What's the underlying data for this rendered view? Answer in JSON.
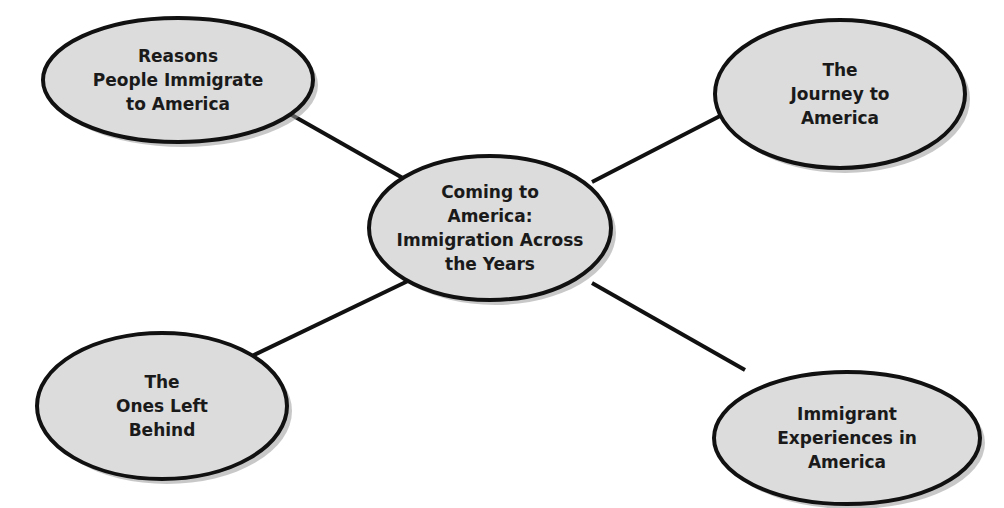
{
  "diagram": {
    "type": "concept-web",
    "colors": {
      "node_fill": "#dcdcdc",
      "node_stroke": "#111111",
      "edge": "#111111",
      "shadow": "#9a9a9a",
      "text": "#1a1a1a"
    },
    "center": {
      "id": "center",
      "label": "Coming to\nAmerica:\nImmigration Across\nthe Years",
      "cx": 490,
      "cy": 228,
      "rx": 121,
      "ry": 72
    },
    "nodes": [
      {
        "id": "reasons",
        "label": "Reasons\nPeople Immigrate\nto America",
        "cx": 178,
        "cy": 80,
        "rx": 135,
        "ry": 62
      },
      {
        "id": "journey",
        "label": "The\nJourney to\nAmerica",
        "cx": 840,
        "cy": 94,
        "rx": 125,
        "ry": 74
      },
      {
        "id": "left-behind",
        "label": "The\nOnes Left\nBehind",
        "cx": 162,
        "cy": 406,
        "rx": 125,
        "ry": 73
      },
      {
        "id": "experiences",
        "label": "Immigrant\nExperiences in\nAmerica",
        "cx": 847,
        "cy": 438,
        "rx": 133,
        "ry": 66
      }
    ],
    "edges": [
      {
        "from": "center",
        "to": "reasons",
        "x1": 408,
        "y1": 181,
        "x2": 290,
        "y2": 114
      },
      {
        "from": "center",
        "to": "journey",
        "x1": 592,
        "y1": 182,
        "x2": 720,
        "y2": 116
      },
      {
        "from": "center",
        "to": "left-behind",
        "x1": 410,
        "y1": 280,
        "x2": 252,
        "y2": 356
      },
      {
        "from": "center",
        "to": "experiences",
        "x1": 592,
        "y1": 283,
        "x2": 745,
        "y2": 370
      }
    ]
  }
}
